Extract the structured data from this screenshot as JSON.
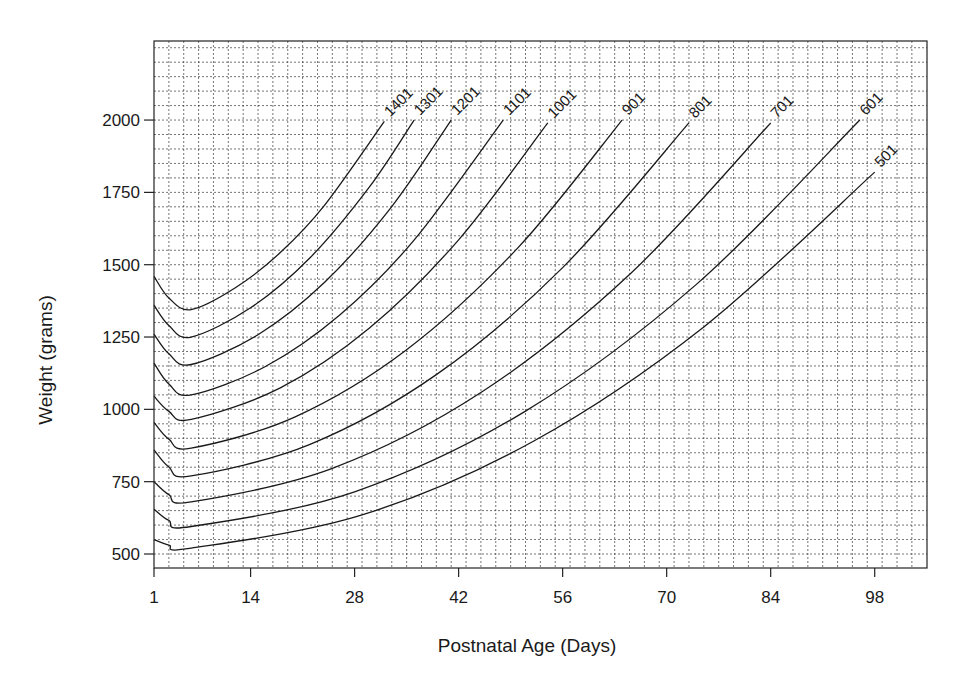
{
  "chart_data": {
    "type": "line",
    "title": "",
    "xlabel": "Postnatal Age (Days)",
    "ylabel": "Weight (grams)",
    "xlim": [
      1,
      105
    ],
    "ylim": [
      452,
      2277
    ],
    "x_ticks": [
      1,
      14,
      28,
      42,
      56,
      70,
      84,
      98
    ],
    "y_ticks": [
      500,
      750,
      1000,
      1250,
      1500,
      1750,
      2000
    ],
    "grid": true,
    "grid_x_step_days": 2,
    "grid_y_step_grams": 50,
    "legend": "inline curve labels at end of each line",
    "series": [
      {
        "name": "1401",
        "points": [
          [
            1,
            1460
          ],
          [
            3,
            1385
          ],
          [
            6,
            1345
          ],
          [
            12,
            1421
          ],
          [
            18,
            1542
          ],
          [
            24,
            1707
          ],
          [
            32,
            1995
          ]
        ]
      },
      {
        "name": "1301",
        "points": [
          [
            1,
            1360
          ],
          [
            3,
            1290
          ],
          [
            6,
            1250
          ],
          [
            14,
            1351
          ],
          [
            22,
            1524
          ],
          [
            30,
            1769
          ],
          [
            36,
            2000
          ]
        ]
      },
      {
        "name": "1201",
        "points": [
          [
            1,
            1260
          ],
          [
            3,
            1192
          ],
          [
            6,
            1155
          ],
          [
            15,
            1258
          ],
          [
            24,
            1440
          ],
          [
            33,
            1701
          ],
          [
            41,
            2000
          ]
        ]
      },
      {
        "name": "1101",
        "points": [
          [
            1,
            1160
          ],
          [
            3,
            1088
          ],
          [
            6,
            1050
          ],
          [
            16,
            1148
          ],
          [
            26,
            1326
          ],
          [
            36,
            1585
          ],
          [
            48,
            2000
          ]
        ]
      },
      {
        "name": "1001",
        "points": [
          [
            1,
            1045
          ],
          [
            3,
            993
          ],
          [
            6,
            965
          ],
          [
            18,
            1074
          ],
          [
            30,
            1281
          ],
          [
            42,
            1586
          ],
          [
            54,
            1990
          ]
        ]
      },
      {
        "name": "901",
        "points": [
          [
            1,
            955
          ],
          [
            3,
            897
          ],
          [
            6,
            866
          ],
          [
            20,
            974
          ],
          [
            35,
            1206
          ],
          [
            50,
            1559
          ],
          [
            64,
            2000
          ]
        ]
      },
      {
        "name": "801",
        "points": [
          [
            1,
            860
          ],
          [
            3,
            801
          ],
          [
            6,
            770
          ],
          [
            22,
            879
          ],
          [
            39,
            1120
          ],
          [
            56,
            1490
          ],
          [
            73,
            1990
          ]
        ]
      },
      {
        "name": "701",
        "points": [
          [
            1,
            750
          ],
          [
            3,
            705
          ],
          [
            6,
            680
          ],
          [
            25,
            796
          ],
          [
            45,
            1058
          ],
          [
            65,
            1466
          ],
          [
            84,
            1990
          ]
        ]
      },
      {
        "name": "601",
        "points": [
          [
            1,
            655
          ],
          [
            3,
            616
          ],
          [
            6,
            595
          ],
          [
            28,
            715
          ],
          [
            51,
            994
          ],
          [
            74,
            1432
          ],
          [
            96,
            2000
          ]
        ]
      },
      {
        "name": "501",
        "points": [
          [
            1,
            550
          ],
          [
            3,
            531
          ],
          [
            6,
            520
          ],
          [
            29,
            635
          ],
          [
            52,
            889
          ],
          [
            75,
            1285
          ],
          [
            98,
            1820
          ]
        ]
      }
    ]
  },
  "colors": {
    "line": "#1a1a1a",
    "grid": "#333333",
    "background": "#ffffff"
  }
}
